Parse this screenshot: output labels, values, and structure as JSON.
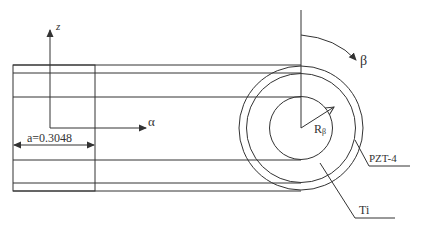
{
  "diagram": {
    "colors": {
      "stroke": "#333333",
      "background": "#ffffff"
    },
    "axes": {
      "z_label": "z",
      "alpha_label": "α",
      "beta_label": "β"
    },
    "dimension": {
      "label": "a=0.3048"
    },
    "radius": {
      "label_main": "R",
      "label_sub": "β"
    },
    "materials": {
      "outer_ring": "PZT-4",
      "inner": "Ti"
    }
  }
}
